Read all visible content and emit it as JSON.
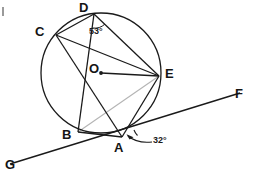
{
  "figure": {
    "type": "circle-geometry-diagram",
    "background_color": "#ffffff",
    "stroke_color": "#1a1a1a",
    "faint_stroke_color": "#b0b0b0",
    "width": 259,
    "height": 189
  },
  "circle": {
    "center_label": "O",
    "cx": 101,
    "cy": 73,
    "r": 60
  },
  "points": [
    {
      "id": "D",
      "label": "D",
      "x": 94,
      "y": 14,
      "label_x": 79,
      "label_y": 1
    },
    {
      "id": "C",
      "label": "C",
      "x": 56,
      "y": 35,
      "label_x": 35,
      "label_y": 25
    },
    {
      "id": "O",
      "label": "O",
      "x": 101,
      "y": 73,
      "label_x": 91,
      "label_y": 65
    },
    {
      "id": "E",
      "label": "E",
      "x": 159,
      "y": 76,
      "label_x": 164,
      "label_y": 67
    },
    {
      "id": "B",
      "label": "B",
      "x": 78,
      "y": 132,
      "label_x": 62,
      "label_y": 129
    },
    {
      "id": "A",
      "label": "A",
      "x": 122,
      "y": 137,
      "label_x": 113,
      "label_y": 140
    },
    {
      "id": "F",
      "label": "F",
      "x": 238,
      "y": 94,
      "label_x": 234,
      "label_y": 88
    },
    {
      "id": "G",
      "label": "G",
      "x": 10,
      "y": 164,
      "label_x": 5,
      "label_y": 159
    }
  ],
  "chords": [
    {
      "name": "chord-CD",
      "from": "C",
      "to": "D",
      "style": "solid"
    },
    {
      "name": "chord-CE",
      "from": "C",
      "to": "E",
      "style": "solid"
    },
    {
      "name": "chord-CA",
      "from": "C",
      "to": "A",
      "style": "solid"
    },
    {
      "name": "chord-DB",
      "from": "D",
      "to": "B",
      "style": "solid"
    },
    {
      "name": "chord-DE",
      "from": "D",
      "to": "E",
      "style": "solid"
    },
    {
      "name": "chord-BE",
      "from": "B",
      "to": "E",
      "style": "faint"
    },
    {
      "name": "chord-BA",
      "from": "B",
      "to": "A",
      "style": "solid"
    },
    {
      "name": "chord-AE",
      "from": "A",
      "to": "E",
      "style": "solid"
    },
    {
      "name": "radius-OE",
      "from": "O",
      "to": "E",
      "style": "solid"
    }
  ],
  "secant_line": {
    "name": "line-GF",
    "from": "G",
    "to": "F",
    "through": "A"
  },
  "angles": [
    {
      "id": "angle-D",
      "value": "53°",
      "vertex": "D",
      "between": [
        "DB",
        "DE"
      ],
      "label_x": 103,
      "label_y": 27
    },
    {
      "id": "angle-A",
      "value": "32°",
      "vertex": "A",
      "between": [
        "AE",
        "AF"
      ],
      "label_x": 155,
      "label_y": 140
    }
  ],
  "labels": {
    "D": "D",
    "C": "C",
    "O": "O",
    "E": "E",
    "B": "B",
    "A": "A",
    "F": "F",
    "G": "G",
    "angle_D": "53°",
    "angle_A": "32°"
  }
}
